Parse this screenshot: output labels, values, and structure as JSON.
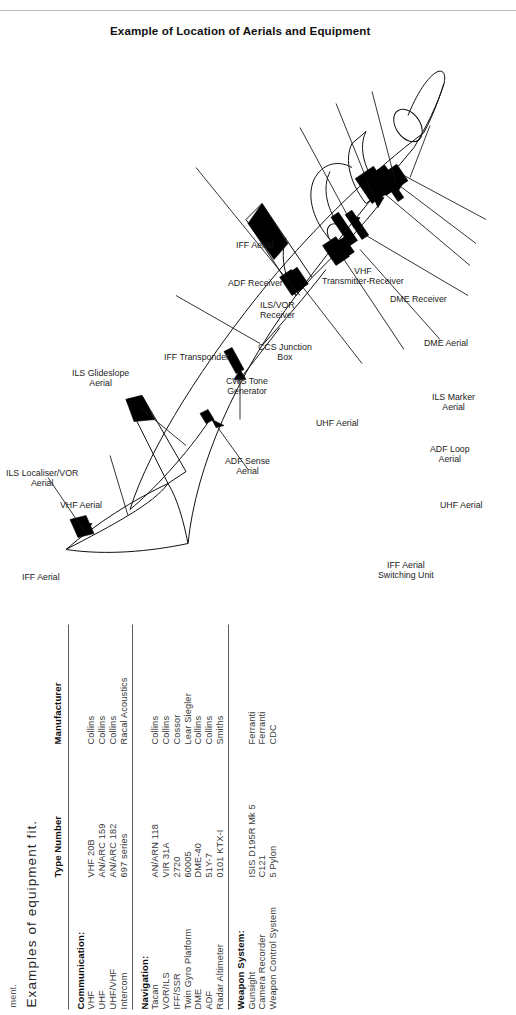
{
  "page": {
    "cut_note": "ment.",
    "intro_text": "Examples of equipment fit."
  },
  "table": {
    "headers": [
      "",
      "Type Number",
      "Manufacturer"
    ],
    "groups": [
      {
        "title": "Communication:",
        "rows": [
          {
            "item": "VHF",
            "type": "VHF 20B",
            "maker": "Collins"
          },
          {
            "item": "UHF",
            "type": "AN/ARC 159",
            "maker": "Collins"
          },
          {
            "item": "UHF/VHF",
            "type": "AN/ARC 182",
            "maker": "Collins"
          },
          {
            "item": "Intercom",
            "type": "697 series",
            "maker": "Racal Acoustics"
          }
        ]
      },
      {
        "title": "Navigation:",
        "rows": [
          {
            "item": "Tacan",
            "type": "AN/ARN 118",
            "maker": "Collins"
          },
          {
            "item": "VOR/ILS",
            "type": "VIR 31A",
            "maker": "Collins"
          },
          {
            "item": "IFF/SSR",
            "type": "2720",
            "maker": "Cossor"
          },
          {
            "item": "Twin Gyro Platform",
            "type": "60005",
            "maker": "Lear Siegler"
          },
          {
            "item": "DME",
            "type": "DME-40",
            "maker": "Collins"
          },
          {
            "item": "ADF",
            "type": "51Y-7",
            "maker": "Collins"
          },
          {
            "item": "Radar Altimeter",
            "type": "0101 KTX-I",
            "maker": "Smiths"
          }
        ]
      },
      {
        "title": "Weapon System:",
        "rows": [
          {
            "item": "Gunsight",
            "type": "ISIS D195R Mk 5",
            "maker": "Ferranti"
          },
          {
            "item": "Camera Recorder",
            "type": "C121",
            "maker": "Ferranti"
          },
          {
            "item": "Weapon Control System",
            "type": "5 Pylon",
            "maker": "CDC"
          }
        ]
      }
    ]
  },
  "figure": {
    "caption": "Example of Location of Aerials and Equipment",
    "callouts": [
      {
        "key": "vhf-aerial",
        "text": "VHF Aerial"
      },
      {
        "key": "adf-sense-aerial",
        "text": "ADF Sense\nAerial"
      },
      {
        "key": "uhf-aerial-top",
        "text": "UHF Aerial"
      },
      {
        "key": "iff-aerial-tail",
        "text": "IFF Aerial"
      },
      {
        "key": "ils-localiser-vor-aerial",
        "text": "ILS Localiser/VOR\nAerial"
      },
      {
        "key": "ils-glideslope-aerial",
        "text": "ILS Glideslope\nAerial"
      },
      {
        "key": "iff-transponder",
        "text": "IFF Transponder"
      },
      {
        "key": "cws-tone-generator",
        "text": "CWS Tone\nGenerator"
      },
      {
        "key": "ccs-junction-box",
        "text": "CCS Junction\nBox"
      },
      {
        "key": "ils-vor-receiver",
        "text": "ILS/VOR\nReceiver"
      },
      {
        "key": "adf-receiver",
        "text": "ADF Receiver"
      },
      {
        "key": "iff-aerial-lower",
        "text": "IFF Aerial"
      },
      {
        "key": "vhf-transmitter-receiver",
        "text": "VHF\nTransmitter-Receiver"
      },
      {
        "key": "dme-receiver",
        "text": "DME Receiver"
      },
      {
        "key": "dme-aerial",
        "text": "DME Aerial"
      },
      {
        "key": "ils-marker-aerial",
        "text": "ILS Marker\nAerial"
      },
      {
        "key": "adf-loop-aerial",
        "text": "ADF Loop\nAerial"
      },
      {
        "key": "uhf-aerial-lower",
        "text": "UHF Aerial"
      },
      {
        "key": "iff-aerial-switching-unit",
        "text": "IFF Aerial\nSwitching Unit"
      }
    ]
  }
}
